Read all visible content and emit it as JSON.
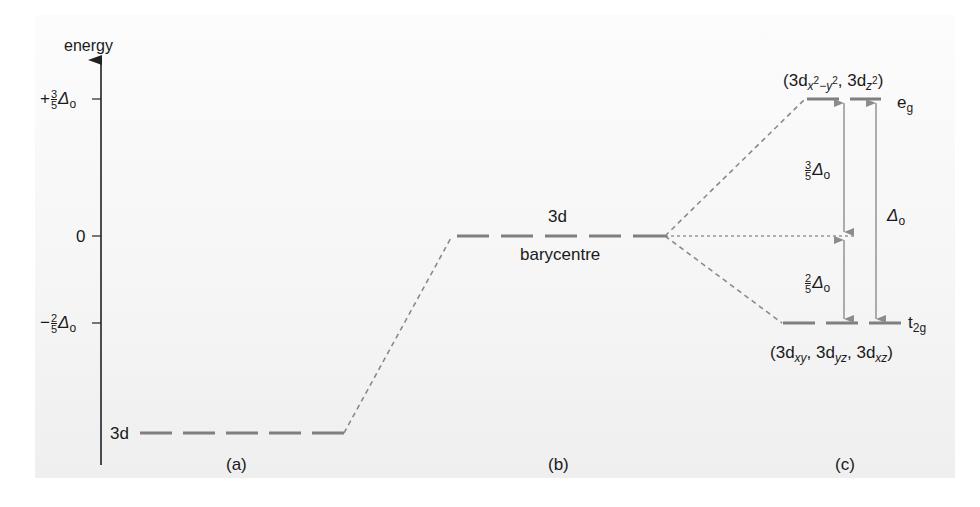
{
  "diagram": {
    "axis": {
      "label": "energy",
      "ticks": [
        {
          "id": "plus_three_fifths",
          "sign": "+",
          "num": "3",
          "den": "5",
          "symbol": "Δ",
          "subscript": "o",
          "y": 99
        },
        {
          "id": "zero",
          "text": "0",
          "y": 236
        },
        {
          "id": "minus_two_fifths",
          "sign": "−",
          "num": "2",
          "den": "5",
          "symbol": "Δ",
          "subscript": "o",
          "y": 323
        }
      ]
    },
    "panels": {
      "a": {
        "label": "(a)",
        "level_label": "3d",
        "level_y": 433,
        "description": "free ion 3d level"
      },
      "b": {
        "label": "(b)",
        "level_label": "3d",
        "sublabel": "barycentre",
        "level_y": 236,
        "description": "spherical field raises 3d energies"
      },
      "c": {
        "label": "(c)",
        "description": "octahedral field splits the 3d level",
        "upper": {
          "name": "e",
          "subscript": "g",
          "orbitals": [
            "3d x²−y²",
            "3d z²"
          ],
          "orbital_label_parts": {
            "open": "(",
            "o1_main": "3d",
            "o1_sub_a": "x",
            "o1_sup_a": "2",
            "o1_sub_minus": "−",
            "o1_sub_b": "y",
            "o1_sup_b": "2",
            "sep": ", ",
            "o2_main": "3d",
            "o2_sub": "z",
            "o2_sup": "2",
            "close": ")"
          },
          "energy": "+3/5 Δo",
          "level_y": 99
        },
        "lower": {
          "name": "t",
          "subscript": "2g",
          "orbitals": [
            "3d xy",
            "3d yz",
            "3d xz"
          ],
          "orbital_label_parts": {
            "open": "(",
            "main": "3d",
            "sub1": "xy",
            "sub2": "yz",
            "sub3": "xz",
            "sep": ", ",
            "close": ")"
          },
          "energy": "−2/5 Δo",
          "level_y": 323
        },
        "gaps": [
          {
            "id": "upper_gap",
            "num": "3",
            "den": "5",
            "symbol": "Δ",
            "subscript": "o"
          },
          {
            "id": "lower_gap",
            "num": "2",
            "den": "5",
            "symbol": "Δ",
            "subscript": "o"
          },
          {
            "id": "total_gap",
            "symbol": "Δ",
            "subscript": "o"
          }
        ]
      }
    },
    "colors": {
      "level_line": "#7f7f7f",
      "connector": "#8a8a8a",
      "arrow": "#8c8c8c",
      "axis": "#222222",
      "text": "#1a1a1a",
      "panel_top": "#fcfcfc",
      "panel_bottom": "#efefef"
    }
  }
}
